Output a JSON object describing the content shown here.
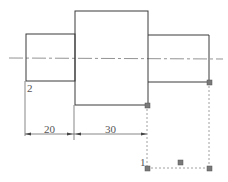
{
  "drawing": {
    "type": "stepped shaft technical drawing",
    "colors": {
      "outline": "#3a3a3a",
      "centerline": "#777777",
      "grip": "#7a7a7a",
      "dashed": "#888888"
    },
    "dimensions": [
      {
        "id": "left-step",
        "value": "20"
      },
      {
        "id": "middle-step",
        "value": "30"
      }
    ],
    "point_labels": {
      "p1": "1",
      "p2": "2"
    }
  }
}
